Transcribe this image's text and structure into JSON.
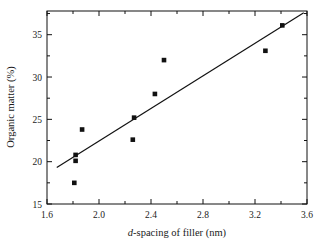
{
  "chart_data": {
    "type": "scatter",
    "title": "",
    "xlabel": "d-spacing of filler (nm)",
    "xlabel_prefix": "d",
    "xlabel_rest": "-spacing of filler (nm)",
    "ylabel": "Organic matter (%)",
    "xlim": [
      1.6,
      3.6
    ],
    "ylim": [
      15,
      37.8
    ],
    "xticks": [
      1.6,
      2.0,
      2.4,
      2.8,
      3.2,
      3.6
    ],
    "xtick_labels": [
      "1.6",
      "2.0",
      "2.4",
      "2.8",
      "3.2",
      "3.6"
    ],
    "xminor_ticks": [
      1.8,
      2.2,
      2.6,
      3.0,
      3.4
    ],
    "yticks": [
      15,
      20,
      25,
      30,
      35
    ],
    "ytick_labels": [
      "15",
      "20",
      "25",
      "30",
      "35"
    ],
    "yminor_ticks": [
      17.5,
      22.5,
      27.5,
      32.5,
      37.5
    ],
    "grid": false,
    "legend": false,
    "marker": "filled-square",
    "marker_color": "#111111",
    "line_color": "#111111",
    "points": [
      {
        "x": 1.81,
        "y": 17.5
      },
      {
        "x": 1.82,
        "y": 20.1
      },
      {
        "x": 1.82,
        "y": 20.8
      },
      {
        "x": 1.87,
        "y": 23.8
      },
      {
        "x": 2.26,
        "y": 22.6
      },
      {
        "x": 2.27,
        "y": 25.2
      },
      {
        "x": 2.43,
        "y": 28.0
      },
      {
        "x": 2.5,
        "y": 32.0
      },
      {
        "x": 3.28,
        "y": 33.1
      },
      {
        "x": 3.41,
        "y": 36.1
      }
    ],
    "fit_line": {
      "x1": 1.675,
      "y1": 19.3,
      "x2": 3.575,
      "y2": 37.6
    }
  }
}
